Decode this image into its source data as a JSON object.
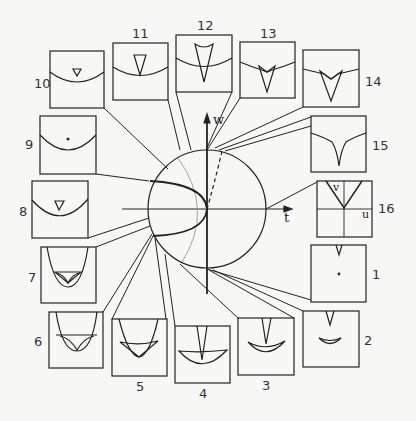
{
  "diagram": {
    "type": "bifurcation diagram with circular parameter plane and 16 surrounding panels",
    "axes": {
      "horizontal_label": "t",
      "vertical_label": "w"
    },
    "inset_axes": {
      "horizontal_label": "u",
      "vertical_label": "v"
    },
    "panels": [
      {
        "id": 1,
        "label": "1"
      },
      {
        "id": 2,
        "label": "2"
      },
      {
        "id": 3,
        "label": "3"
      },
      {
        "id": 4,
        "label": "4"
      },
      {
        "id": 5,
        "label": "5"
      },
      {
        "id": 6,
        "label": "6"
      },
      {
        "id": 7,
        "label": "7"
      },
      {
        "id": 8,
        "label": "8"
      },
      {
        "id": 9,
        "label": "9"
      },
      {
        "id": 10,
        "label": "10"
      },
      {
        "id": 11,
        "label": "11"
      },
      {
        "id": 12,
        "label": "12"
      },
      {
        "id": 13,
        "label": "13"
      },
      {
        "id": 14,
        "label": "14"
      },
      {
        "id": 15,
        "label": "15"
      },
      {
        "id": 16,
        "label": "16"
      }
    ],
    "colors": {
      "ink": "#222222",
      "grey_curve": "#9a9a9a",
      "background": "#f7f7f5"
    }
  }
}
